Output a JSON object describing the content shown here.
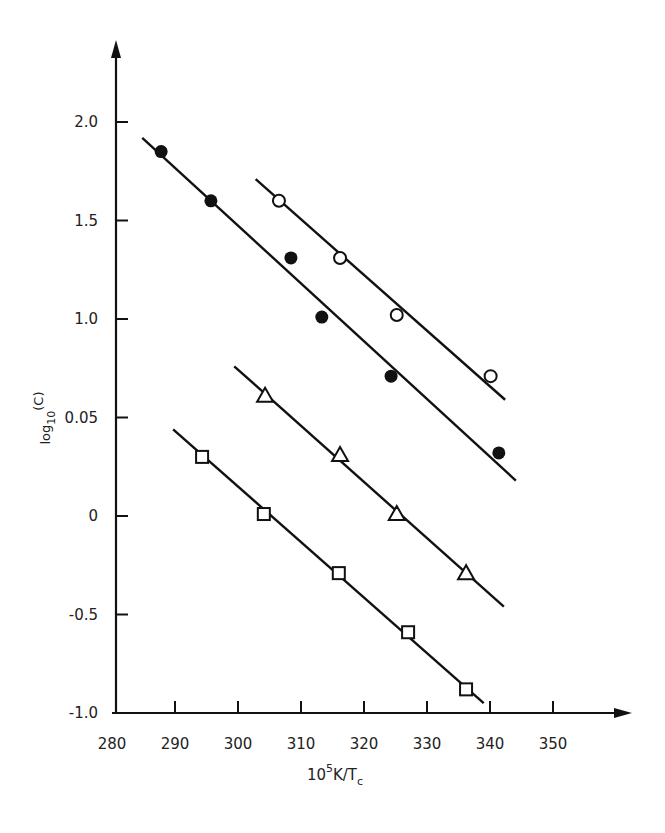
{
  "chart_data": {
    "type": "scatter",
    "title": "",
    "xlabel": "10^5 K/T_c",
    "xlabel_parts": {
      "base": "10",
      "sup": "5",
      "mid": "K/T",
      "sub": "c"
    },
    "ylabel": "log10(C)",
    "ylabel_parts": {
      "base": "log",
      "sub": "10",
      "rest": "(C)"
    },
    "x_ticks": [
      280,
      290,
      300,
      310,
      320,
      330,
      340,
      350
    ],
    "y_ticks": [
      {
        "value": 2.0,
        "label": "2.0"
      },
      {
        "value": 1.5,
        "label": "1.5"
      },
      {
        "value": 1.0,
        "label": "1.0"
      },
      {
        "value": 0.5,
        "label": "0.05"
      },
      {
        "value": 0.0,
        "label": "0"
      },
      {
        "value": -0.5,
        "label": "-0.5"
      },
      {
        "value": -1.0,
        "label": "-1.0"
      }
    ],
    "xlim": [
      280,
      360
    ],
    "ylim": [
      -1.0,
      2.3
    ],
    "grid": false,
    "legend": "none",
    "series": [
      {
        "name": "filled circles",
        "marker": "filled-circle",
        "points": [
          [
            287.8,
            1.85
          ],
          [
            295.7,
            1.6
          ],
          [
            308.4,
            1.31
          ],
          [
            313.3,
            1.01
          ],
          [
            324.3,
            0.71
          ],
          [
            341.4,
            0.32
          ]
        ],
        "fit_line": [
          [
            284.8,
            1.92
          ],
          [
            344.1,
            0.18
          ]
        ]
      },
      {
        "name": "open circles",
        "marker": "open-circle",
        "points": [
          [
            306.5,
            1.6
          ],
          [
            316.2,
            1.31
          ],
          [
            325.2,
            1.02
          ],
          [
            340.1,
            0.71
          ]
        ],
        "fit_line": [
          [
            302.8,
            1.71
          ],
          [
            342.4,
            0.59
          ]
        ]
      },
      {
        "name": "open triangles",
        "marker": "open-triangle",
        "points": [
          [
            304.3,
            0.61
          ],
          [
            316.2,
            0.31
          ],
          [
            325.2,
            0.01
          ],
          [
            336.2,
            -0.29
          ]
        ],
        "fit_line": [
          [
            299.4,
            0.76
          ],
          [
            342.2,
            -0.46
          ]
        ]
      },
      {
        "name": "open squares",
        "marker": "open-square",
        "points": [
          [
            294.3,
            0.3
          ],
          [
            304.1,
            0.01
          ],
          [
            316.0,
            -0.29
          ],
          [
            327.0,
            -0.59
          ],
          [
            336.2,
            -0.88
          ]
        ],
        "fit_line": [
          [
            289.7,
            0.44
          ],
          [
            339.0,
            -0.95
          ]
        ]
      }
    ]
  }
}
